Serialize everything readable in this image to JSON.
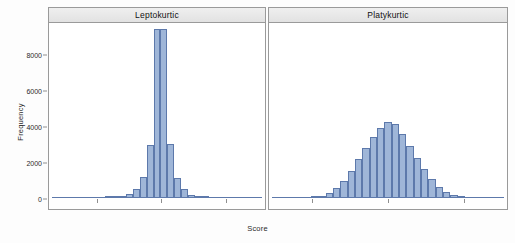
{
  "chart_data": {
    "type": "bar",
    "title": "",
    "xlabel": "Score",
    "ylabel": "Frequency",
    "ylim": [
      0,
      9800
    ],
    "yticks": [
      0,
      2000,
      4000,
      6000,
      8000
    ],
    "ytick_labels": [
      "0",
      "2000",
      "4000",
      "6000",
      "8000"
    ],
    "grid": false,
    "legend": false,
    "panels": [
      {
        "label": "Leptokurtic",
        "bin_count": 15,
        "values": [
          20,
          45,
          90,
          210,
          520,
          1150,
          2950,
          9400,
          9400,
          2980,
          1100,
          480,
          180,
          70,
          25
        ]
      },
      {
        "label": "Platykurtic",
        "bin_count": 21,
        "values": [
          60,
          130,
          290,
          560,
          950,
          1500,
          2150,
          2800,
          3400,
          3900,
          4250,
          4100,
          3550,
          2900,
          2250,
          1600,
          1050,
          620,
          330,
          150,
          60
        ]
      }
    ]
  }
}
